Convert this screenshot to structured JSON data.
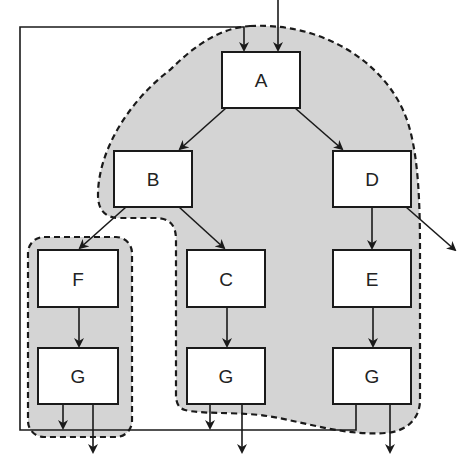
{
  "diagram": {
    "colors": {
      "region_fill": "#d4d4d4",
      "line": "#1a1a1a",
      "box_fill": "#ffffff",
      "background": "#ffffff"
    },
    "nodes": [
      {
        "id": "A",
        "label": "A",
        "x": 222,
        "y": 52,
        "w": 78,
        "h": 56
      },
      {
        "id": "B",
        "label": "B",
        "x": 114,
        "y": 151,
        "w": 78,
        "h": 56
      },
      {
        "id": "D",
        "label": "D",
        "x": 333,
        "y": 151,
        "w": 78,
        "h": 56
      },
      {
        "id": "F",
        "label": "F",
        "x": 38,
        "y": 250,
        "w": 80,
        "h": 57
      },
      {
        "id": "C",
        "label": "C",
        "x": 187,
        "y": 250,
        "w": 78,
        "h": 57
      },
      {
        "id": "E",
        "label": "E",
        "x": 333,
        "y": 250,
        "w": 78,
        "h": 57
      },
      {
        "id": "G1",
        "label": "G",
        "x": 38,
        "y": 348,
        "w": 80,
        "h": 56
      },
      {
        "id": "G2",
        "label": "G",
        "x": 187,
        "y": 348,
        "w": 78,
        "h": 56
      },
      {
        "id": "G3",
        "label": "G",
        "x": 333,
        "y": 348,
        "w": 78,
        "h": 56
      }
    ],
    "edges": [
      {
        "from": "A",
        "to": "B"
      },
      {
        "from": "A",
        "to": "D"
      },
      {
        "from": "B",
        "to": "F"
      },
      {
        "from": "B",
        "to": "C"
      },
      {
        "from": "D",
        "to": "E"
      },
      {
        "from": "F",
        "to": "G1"
      },
      {
        "from": "C",
        "to": "G2"
      },
      {
        "from": "E",
        "to": "G3"
      },
      {
        "from": "D",
        "to": "exit-right"
      },
      {
        "from": "external",
        "to": "A"
      },
      {
        "from": "feedback-loop",
        "to": "A"
      }
    ],
    "regions": [
      {
        "id": "region-large",
        "contains": [
          "A",
          "B",
          "C",
          "D",
          "E",
          "G2",
          "G3"
        ],
        "style": "dashed"
      },
      {
        "id": "region-small",
        "contains": [
          "F",
          "G1"
        ],
        "style": "dashed"
      }
    ]
  }
}
